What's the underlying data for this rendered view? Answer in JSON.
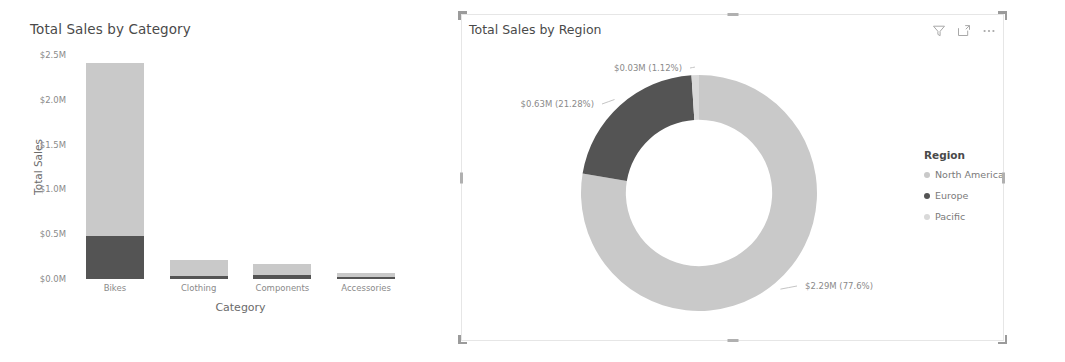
{
  "colors": {
    "north_america": "#c9c9c9",
    "europe": "#545454",
    "pacific": "#d9d9d9",
    "text_muted": "#8a8a8a",
    "text_title": "#4a4a4a",
    "panel_border": "#e6e6e6",
    "handle": "#9b9b9b"
  },
  "bar_visual": {
    "title": "Total Sales by Category"
  },
  "donut_visual": {
    "title": "Total Sales by Region",
    "header_icons": [
      {
        "name": "filter-icon",
        "label": "Filters"
      },
      {
        "name": "focus-mode-icon",
        "label": "Focus mode"
      },
      {
        "name": "more-options-icon",
        "label": "More options"
      }
    ],
    "legend": {
      "title": "Region",
      "items": [
        {
          "label": "North America",
          "color": "#c9c9c9"
        },
        {
          "label": "Europe",
          "color": "#545454"
        },
        {
          "label": "Pacific",
          "color": "#d9d9d9"
        }
      ]
    }
  },
  "chart_data": [
    {
      "type": "bar",
      "title": "Total Sales by Category",
      "xlabel": "Category",
      "ylabel": "Total Sales",
      "stacked": true,
      "ylim": [
        0,
        2.5
      ],
      "ytick_labels": [
        "$2.5M",
        "$2.0M",
        "$1.5M",
        "$1.0M",
        "$0.5M",
        "$0.0M"
      ],
      "ytick_values": [
        2.5,
        2.0,
        1.5,
        1.0,
        0.5,
        0.0
      ],
      "categories": [
        "Bikes",
        "Clothing",
        "Components",
        "Accessories"
      ],
      "series": [
        {
          "name": "North America",
          "color": "#c9c9c9",
          "values": [
            1.93,
            0.18,
            0.13,
            0.05
          ]
        },
        {
          "name": "Europe",
          "color": "#545454",
          "values": [
            0.48,
            0.03,
            0.04,
            0.02
          ]
        }
      ],
      "grid": false,
      "legend_position": "none"
    },
    {
      "type": "pie",
      "variant": "donut",
      "title": "Total Sales by Region",
      "labels": [
        "North America",
        "Europe",
        "Pacific"
      ],
      "values": [
        2.29,
        0.63,
        0.03
      ],
      "percents": [
        77.6,
        21.28,
        1.12
      ],
      "colors": [
        "#c9c9c9",
        "#545454",
        "#d9d9d9"
      ],
      "data_labels": [
        "$2.29M (77.6%)",
        "$0.63M (21.28%)",
        "$0.03M (1.12%)"
      ],
      "legend_title": "Region",
      "legend_position": "right",
      "inner_radius_ratio": 0.62
    }
  ]
}
